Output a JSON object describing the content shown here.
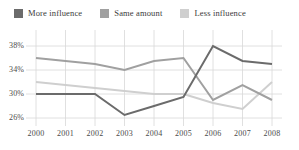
{
  "legend": {
    "position": "top-left",
    "items": [
      {
        "label": "More influence",
        "color": "#6b6b6b",
        "swatch_name": "legend-swatch-more-influence"
      },
      {
        "label": "Same amount",
        "color": "#a0a0a0",
        "swatch_name": "legend-swatch-same-amount"
      },
      {
        "label": "Less influence",
        "color": "#cfcfcf",
        "swatch_name": "legend-swatch-less-influence"
      }
    ]
  },
  "axes": {
    "y_ticks": [
      "38%",
      "34%",
      "30%",
      "26%"
    ],
    "y_tick_values": [
      38,
      34,
      30,
      26
    ],
    "x_ticks": [
      "2000",
      "2001",
      "2002",
      "2003",
      "2004",
      "2005",
      "2006",
      "2007",
      "2008"
    ]
  },
  "chart_data": {
    "type": "line",
    "title": "",
    "subtitle": "",
    "xlabel": "",
    "ylabel": "",
    "x": [
      2000,
      2001,
      2002,
      2003,
      2004,
      2005,
      2006,
      2007,
      2008
    ],
    "categories": [
      "2000",
      "2001",
      "2002",
      "2003",
      "2004",
      "2005",
      "2006",
      "2007",
      "2008"
    ],
    "ylim": [
      25,
      39
    ],
    "xlim": [
      2000,
      2008
    ],
    "grid": true,
    "grid_color": "#d8d8d8",
    "legend_position": "top-left",
    "y_tick_format": "percent",
    "series": [
      {
        "name": "More influence",
        "color": "#6b6b6b",
        "values": [
          30.0,
          30.0,
          30.0,
          26.5,
          28.0,
          29.5,
          38.0,
          35.5,
          35.0
        ]
      },
      {
        "name": "Same amount",
        "color": "#a0a0a0",
        "values": [
          36.0,
          35.5,
          35.0,
          34.0,
          35.5,
          36.0,
          29.0,
          31.5,
          29.0
        ]
      },
      {
        "name": "Less influence",
        "color": "#cfcfcf",
        "values": [
          32.0,
          31.5,
          31.0,
          30.5,
          30.0,
          30.0,
          28.5,
          27.5,
          32.0
        ]
      }
    ]
  }
}
